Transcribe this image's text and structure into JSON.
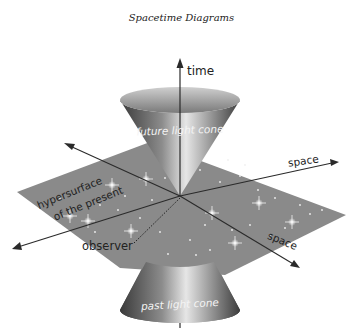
{
  "title": "Spacetime Diagrams",
  "labels": {
    "time": "time",
    "future_cone": "future light cone",
    "past_cone": "past light cone",
    "space_upper": "space",
    "space_lower": "space",
    "hypersurface_line1": "hypersurface",
    "hypersurface_line2": "of the present",
    "observer": "observer"
  },
  "colors": {
    "plane": "#8a8a8a",
    "cone_dark": "#3e3e3e",
    "cone_light": "#d8d8d8",
    "axis": "#2a2a2a",
    "star": "#ffffff"
  }
}
